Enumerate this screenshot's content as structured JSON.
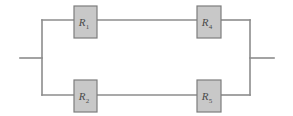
{
  "figure": {
    "background_color": "#ffffff",
    "wire_color": "#8c8c8c",
    "box_fill_color": "#c8c8c8",
    "box_border_color": "#7d7d7d",
    "label_color": "#4a4a4a"
  },
  "components": [
    {
      "id": "r1",
      "symbol": "R",
      "subscript": "1",
      "branch": "top",
      "position": "left"
    },
    {
      "id": "r4",
      "symbol": "R",
      "subscript": "4",
      "branch": "top",
      "position": "right"
    },
    {
      "id": "r2",
      "symbol": "R",
      "subscript": "2",
      "branch": "bottom",
      "position": "left"
    },
    {
      "id": "r5",
      "symbol": "R",
      "subscript": "5",
      "branch": "bottom",
      "position": "right"
    }
  ],
  "terminals": [
    {
      "id": "left-terminal",
      "side": "left"
    },
    {
      "id": "right-terminal",
      "side": "right"
    }
  ]
}
